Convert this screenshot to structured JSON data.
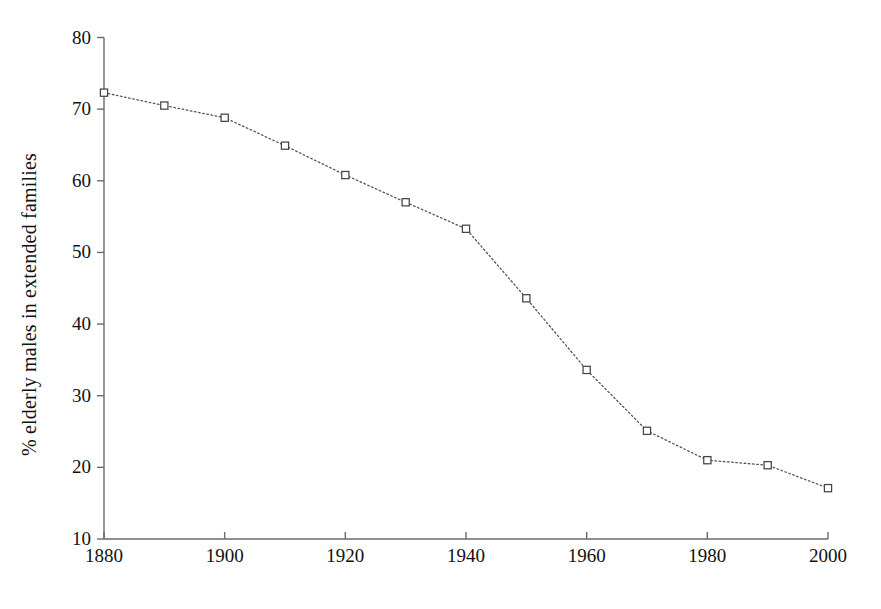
{
  "chart_data": {
    "type": "line",
    "title": "",
    "xlabel": "",
    "ylabel": "% elderly males in extended families",
    "x": [
      1880,
      1890,
      1900,
      1910,
      1920,
      1930,
      1940,
      1950,
      1960,
      1970,
      1980,
      1990,
      2000
    ],
    "values": [
      72.3,
      70.5,
      68.8,
      64.9,
      60.8,
      57.0,
      53.3,
      43.6,
      33.6,
      25.1,
      21.0,
      20.3,
      17.1
    ],
    "series": [
      {
        "name": "% elderly males in extended families",
        "values": [
          72.3,
          70.5,
          68.8,
          64.9,
          60.8,
          57.0,
          53.3,
          43.6,
          33.6,
          25.1,
          21.0,
          20.3,
          17.1
        ]
      }
    ],
    "xlim": [
      1880,
      2000
    ],
    "ylim": [
      10,
      80
    ],
    "xticks": [
      1880,
      1900,
      1920,
      1940,
      1960,
      1980,
      2000
    ],
    "xtick_labels": [
      "1880",
      "1900",
      "1920",
      "1940",
      "1960",
      "1980",
      "2000"
    ],
    "yticks": [
      10,
      20,
      30,
      40,
      50,
      60,
      70,
      80
    ],
    "ytick_labels": [
      "10",
      "20",
      "30",
      "40",
      "50",
      "60",
      "70",
      "80"
    ],
    "grid": false,
    "legend": false,
    "line_style": "dotted",
    "line_color": "#555555",
    "marker": "open-square",
    "marker_color": "#444444",
    "marker_fill": "#ffffff",
    "axis_color": "#6a6a6a",
    "background_color": "#ffffff"
  },
  "axes": {
    "y_axis_title": "% elderly males in extended families"
  }
}
